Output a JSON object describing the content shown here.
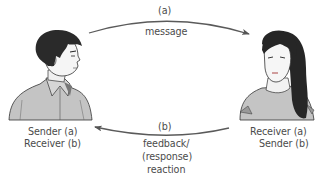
{
  "diagram": {
    "type": "communication-cycle",
    "participants": [
      {
        "id": "left-person",
        "figure": "man",
        "roles": [
          "Sender (a)",
          "Receiver (b)"
        ]
      },
      {
        "id": "right-person",
        "figure": "woman",
        "roles": [
          "Receiver (a)",
          "Sender (b)"
        ]
      }
    ],
    "arrows": [
      {
        "id": "a",
        "from": "left-person",
        "to": "right-person",
        "tag": "(a)",
        "label_lines": [
          "message"
        ]
      },
      {
        "id": "b",
        "from": "right-person",
        "to": "left-person",
        "tag": "(b)",
        "label_lines": [
          "feedback/",
          "(response)",
          "reaction"
        ]
      }
    ],
    "caption": ""
  },
  "colors": {
    "arrow": "#5a5a5a",
    "text": "#4b4b4b",
    "hair": "#2b2b2b",
    "shirt": "#bdbdbd",
    "skin": "#f4f4f4"
  }
}
